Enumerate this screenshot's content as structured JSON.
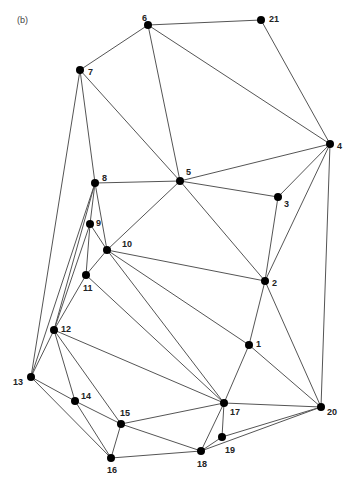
{
  "panel_label": "(b)",
  "colors": {
    "edge": "#555555",
    "node": "#000000",
    "label": "#222222"
  },
  "nodes": [
    {
      "id": "1",
      "x": 249,
      "y": 345,
      "lx": 7,
      "ly": 0
    },
    {
      "id": "2",
      "x": 265,
      "y": 281,
      "lx": 7,
      "ly": 3
    },
    {
      "id": "3",
      "x": 278,
      "y": 197,
      "lx": 6,
      "ly": 8
    },
    {
      "id": "4",
      "x": 330,
      "y": 144,
      "lx": 7,
      "ly": 3
    },
    {
      "id": "5",
      "x": 180,
      "y": 181,
      "lx": 6,
      "ly": -8
    },
    {
      "id": "6",
      "x": 148,
      "y": 25,
      "lx": -6,
      "ly": -6
    },
    {
      "id": "7",
      "x": 80,
      "y": 70,
      "lx": 8,
      "ly": 3
    },
    {
      "id": "8",
      "x": 95,
      "y": 183,
      "lx": 7,
      "ly": -4
    },
    {
      "id": "9",
      "x": 90,
      "y": 224,
      "lx": 6,
      "ly": 0
    },
    {
      "id": "10",
      "x": 107,
      "y": 250,
      "lx": 15,
      "ly": -5
    },
    {
      "id": "11",
      "x": 86,
      "y": 275,
      "lx": -3,
      "ly": 14
    },
    {
      "id": "12",
      "x": 54,
      "y": 330,
      "lx": 7,
      "ly": 0
    },
    {
      "id": "13",
      "x": 31,
      "y": 377,
      "lx": -18,
      "ly": 6
    },
    {
      "id": "14",
      "x": 75,
      "y": 401,
      "lx": 6,
      "ly": -4
    },
    {
      "id": "15",
      "x": 121,
      "y": 424,
      "lx": -1,
      "ly": -10
    },
    {
      "id": "16",
      "x": 111,
      "y": 458,
      "lx": -4,
      "ly": 13
    },
    {
      "id": "17",
      "x": 224,
      "y": 403,
      "lx": 6,
      "ly": 10
    },
    {
      "id": "18",
      "x": 201,
      "y": 451,
      "lx": -4,
      "ly": 14
    },
    {
      "id": "19",
      "x": 222,
      "y": 437,
      "lx": 3,
      "ly": 14
    },
    {
      "id": "20",
      "x": 321,
      "y": 407,
      "lx": 6,
      "ly": 6
    },
    {
      "id": "21",
      "x": 261,
      "y": 20,
      "lx": 8,
      "ly": 0
    }
  ],
  "edges": [
    [
      "6",
      "21"
    ],
    [
      "6",
      "7"
    ],
    [
      "6",
      "5"
    ],
    [
      "6",
      "4"
    ],
    [
      "21",
      "4"
    ],
    [
      "7",
      "5"
    ],
    [
      "7",
      "8"
    ],
    [
      "7",
      "13"
    ],
    [
      "8",
      "5"
    ],
    [
      "4",
      "5"
    ],
    [
      "4",
      "3"
    ],
    [
      "4",
      "2"
    ],
    [
      "4",
      "20"
    ],
    [
      "5",
      "3"
    ],
    [
      "5",
      "10"
    ],
    [
      "5",
      "2"
    ],
    [
      "3",
      "2"
    ],
    [
      "8",
      "9"
    ],
    [
      "8",
      "10"
    ],
    [
      "8",
      "12"
    ],
    [
      "8",
      "13"
    ],
    [
      "9",
      "11"
    ],
    [
      "9",
      "10"
    ],
    [
      "9",
      "12"
    ],
    [
      "10",
      "11"
    ],
    [
      "10",
      "2"
    ],
    [
      "10",
      "1"
    ],
    [
      "10",
      "17"
    ],
    [
      "11",
      "12"
    ],
    [
      "11",
      "17"
    ],
    [
      "12",
      "13"
    ],
    [
      "12",
      "17"
    ],
    [
      "12",
      "14"
    ],
    [
      "12",
      "15"
    ],
    [
      "13",
      "14"
    ],
    [
      "13",
      "16"
    ],
    [
      "14",
      "15"
    ],
    [
      "14",
      "16"
    ],
    [
      "15",
      "16"
    ],
    [
      "15",
      "17"
    ],
    [
      "15",
      "18"
    ],
    [
      "16",
      "18"
    ],
    [
      "2",
      "1"
    ],
    [
      "2",
      "20"
    ],
    [
      "1",
      "17"
    ],
    [
      "1",
      "20"
    ],
    [
      "17",
      "20"
    ],
    [
      "17",
      "19"
    ],
    [
      "17",
      "18"
    ],
    [
      "19",
      "20"
    ],
    [
      "18",
      "20"
    ],
    [
      "18",
      "19"
    ]
  ]
}
